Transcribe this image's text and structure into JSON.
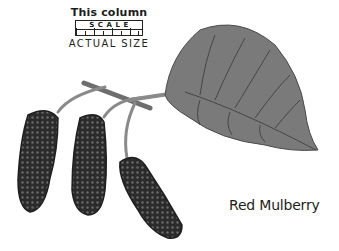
{
  "scale_legend": {
    "caption": "This column",
    "scale_label": "SCALE",
    "actual_size_label": "ACTUAL SIZE"
  },
  "illustration": {
    "subject": "mulberry-branch",
    "parts": [
      "leaf",
      "stems",
      "berry-1",
      "berry-2",
      "berry-3"
    ],
    "colors": {
      "leaf": "#7a7a7a",
      "leaf_vein": "#3a3a3a",
      "berry": "#2a2a2a",
      "stem": "#8a8a8a"
    }
  },
  "species": {
    "name": "Red Mulberry"
  }
}
